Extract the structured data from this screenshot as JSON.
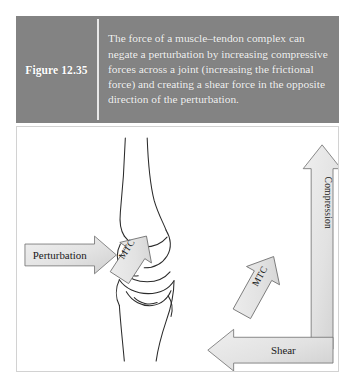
{
  "figure": {
    "number_label": "Figure 12.35",
    "caption": "The force of a muscle–tendon complex can negate a perturbation by increasing compressive forces across a joint (increasing the frictional force) and creating a shear force in the opposite direction of the perturbation.",
    "caption_lines": [
      "The force of a muscle–tendon complex",
      "can negate a perturbation by increasing",
      "compressive forces across a joint",
      "(increasing the frictional force) and",
      "creating a shear force in the opposite",
      "direction of the perturbation."
    ],
    "band_background_color": "#838383",
    "caption_text_color": "#f2f2f2",
    "panel_background_color": "#ffffff",
    "panel_border_color": "#d2d2d2"
  },
  "illustration": {
    "title": "Knee joint with muscle-tendon complex force vectors",
    "anatomy_label": "knee-joint-bones",
    "arrow_fill_color": "#e2e2e2",
    "arrow_stroke_color": "#6d6d6d",
    "bone_stroke_color": "#2b2b2b",
    "arrows": [
      {
        "id": "perturbation",
        "label": "Perturbation",
        "direction": "right",
        "orientation": "horizontal",
        "group": "knee-diagram"
      },
      {
        "id": "mtc-knee",
        "label": "MTC",
        "direction": "up-left",
        "orientation": "diagonal",
        "group": "knee-diagram"
      },
      {
        "id": "mtc-vector",
        "label": "MTC",
        "direction": "up-left",
        "orientation": "diagonal",
        "group": "force-diagram"
      },
      {
        "id": "compression",
        "label": "Compression",
        "direction": "up",
        "orientation": "vertical",
        "group": "force-diagram"
      },
      {
        "id": "shear",
        "label": "Shear",
        "direction": "left",
        "orientation": "horizontal",
        "group": "force-diagram"
      }
    ]
  }
}
